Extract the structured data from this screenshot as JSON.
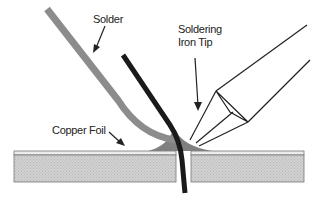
{
  "diagram": {
    "labels": {
      "solder": "Solder",
      "iron_tip_line1": "Soldering",
      "iron_tip_line2": "Iron Tip",
      "copper_foil": "Copper Foil"
    },
    "colors": {
      "solder": "#8c8c8c",
      "lead_wire": "#1a1a1a",
      "board": "#cfcfcf",
      "copper_foil": "#e4e4e4",
      "solder_fillet": "#808080",
      "outline": "#222222"
    }
  }
}
